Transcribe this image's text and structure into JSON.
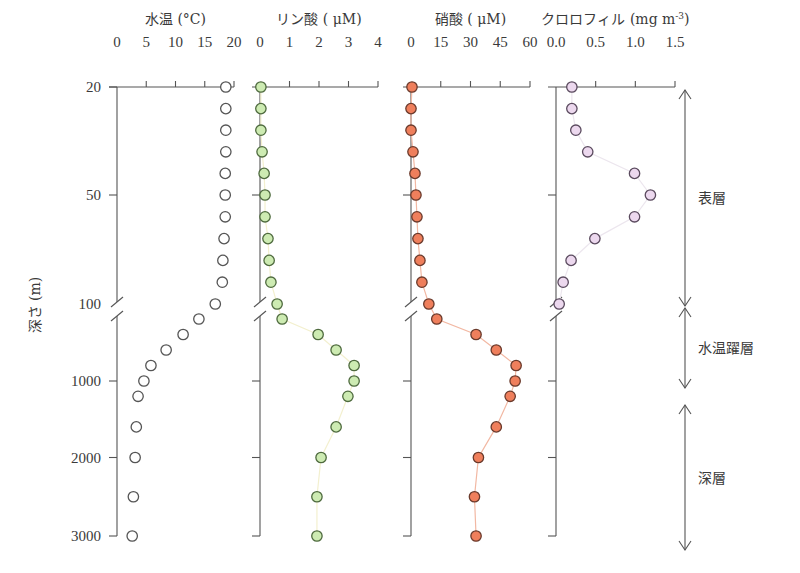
{
  "chart_data": {
    "type": "scatter",
    "title": "",
    "ylabel": "深さ (m)",
    "y_axis": {
      "inverted": true,
      "broken": true,
      "break_at": 100,
      "ticks": [
        20,
        50,
        100,
        1000,
        2000,
        3000
      ],
      "tick_labels": [
        "20",
        "50",
        "100",
        "1000",
        "2000",
        "3000"
      ]
    },
    "depths": [
      20,
      26,
      32,
      38,
      44,
      50,
      60,
      70,
      80,
      90,
      100,
      200,
      400,
      600,
      800,
      1000,
      1200,
      1600,
      2000,
      2500,
      3000
    ],
    "panels": [
      {
        "name": "water-temperature",
        "xlabel": "水温 (°C)",
        "xlim": [
          0,
          20
        ],
        "ticks": [
          0,
          5,
          10,
          15,
          20
        ],
        "tick_labels": [
          "0",
          "5",
          "10",
          "15",
          "20"
        ],
        "marker": "open-circle",
        "fill": "#ffffff",
        "stroke": "#555555",
        "line": "",
        "values": [
          18.6,
          18.6,
          18.6,
          18.6,
          18.5,
          18.5,
          18.5,
          18.3,
          18.1,
          18.0,
          16.8,
          14.0,
          11.3,
          8.4,
          5.8,
          4.6,
          3.6,
          3.3,
          3.1,
          2.8,
          2.6
        ]
      },
      {
        "name": "phosphate",
        "xlabel": "リン酸 ( μM)",
        "xlim": [
          0,
          4
        ],
        "ticks": [
          0,
          1,
          2,
          3,
          4
        ],
        "tick_labels": [
          "0",
          "1",
          "2",
          "3",
          "4"
        ],
        "marker": "filled-circle",
        "fill": "#cdebb2",
        "stroke": "#4e6a3e",
        "line": "#f3f0cf",
        "values": [
          0.03,
          0.03,
          0.03,
          0.07,
          0.14,
          0.17,
          0.17,
          0.27,
          0.31,
          0.37,
          0.58,
          0.75,
          1.97,
          2.58,
          3.19,
          3.19,
          2.98,
          2.58,
          2.07,
          1.93,
          1.93
        ]
      },
      {
        "name": "nitrate",
        "xlabel": "硝酸 ( μM)",
        "xlim": [
          0,
          60
        ],
        "ticks": [
          0,
          15,
          30,
          45,
          60
        ],
        "tick_labels": [
          "0",
          "15",
          "30",
          "45",
          "60"
        ],
        "marker": "filled-circle",
        "fill": "#ef7f5c",
        "stroke": "#6a3a2c",
        "line": "#f2b8a3",
        "values": [
          0.5,
          0,
          0,
          1,
          2,
          2.5,
          3,
          3.5,
          4.5,
          5.5,
          9,
          13,
          32.8,
          43,
          53,
          52.5,
          50,
          43,
          34,
          32,
          32.8
        ]
      },
      {
        "name": "chlorophyll",
        "xlabel": "クロロフィル (mg m",
        "xlabel_sup": "-3",
        "xlabel_end": ")",
        "xlim": [
          0,
          1.5
        ],
        "ticks": [
          0,
          0.5,
          1.0,
          1.5
        ],
        "tick_labels": [
          "0.0",
          "0.5",
          "1.0",
          "1.5"
        ],
        "marker": "filled-circle",
        "fill": "#ecd8ee",
        "stroke": "#5a4a5e",
        "line": "#ece6ee",
        "values": [
          0.2,
          0.2,
          0.25,
          0.4,
          0.99,
          1.19,
          0.99,
          0.49,
          0.19,
          0.09,
          0.04
        ]
      }
    ],
    "layers": [
      {
        "name": "surface-layer",
        "label": "表層",
        "from": 20,
        "to": 100
      },
      {
        "name": "thermocline",
        "label": "水温躍層",
        "from": 100,
        "to": 1000
      },
      {
        "name": "deep-layer",
        "label": "深層",
        "from": 1200,
        "to": 3000
      }
    ]
  }
}
